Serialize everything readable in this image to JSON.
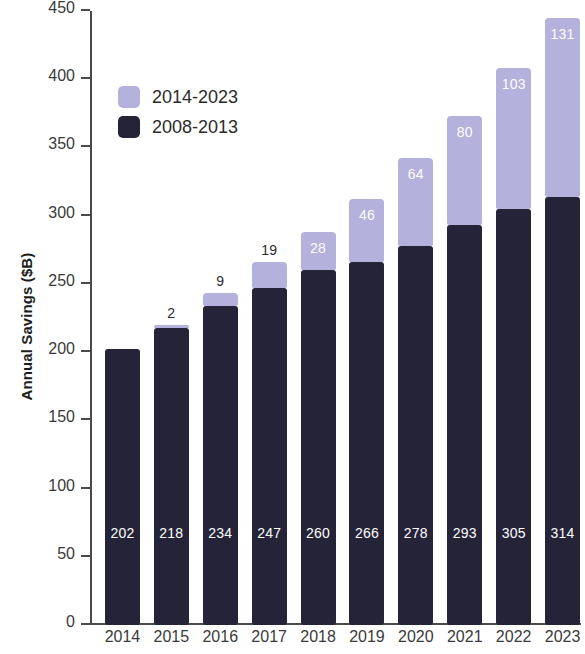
{
  "chart_data": {
    "type": "bar",
    "subtype": "stacked-vertical",
    "title": "",
    "xlabel": "",
    "ylabel": "Annual Savings ($B)",
    "ylim": [
      0,
      450
    ],
    "ytick_step": 50,
    "yticks": [
      450,
      400,
      350,
      300,
      250,
      200,
      150,
      100,
      50,
      0
    ],
    "ytick_labels": [
      "450",
      "400",
      "350",
      "300",
      "250",
      "200",
      "150",
      "100",
      "50",
      "0"
    ],
    "grid": false,
    "legend_position": "upper-left-inside",
    "categories": [
      "2014",
      "2015",
      "2016",
      "2017",
      "2018",
      "2019",
      "2020",
      "2021",
      "2022",
      "2023"
    ],
    "series": [
      {
        "name": "2008-2013",
        "color": "#252338",
        "values": [
          202,
          218,
          234,
          247,
          260,
          266,
          278,
          293,
          305,
          314
        ],
        "labels": [
          "202",
          "218",
          "234",
          "247",
          "260",
          "266",
          "278",
          "293",
          "305",
          "314"
        ]
      },
      {
        "name": "2014-2023",
        "color": "#b4b1dc",
        "values": [
          0,
          2,
          9,
          19,
          28,
          46,
          64,
          80,
          103,
          131
        ],
        "labels": [
          "",
          "2",
          "9",
          "19",
          "28",
          "46",
          "64",
          "80",
          "103",
          "131"
        ]
      }
    ],
    "totals": [
      202,
      220,
      243,
      266,
      288,
      312,
      342,
      373,
      408,
      445
    ]
  },
  "legend": {
    "items": [
      {
        "label": "2014-2023",
        "color": "#b4b1dc"
      },
      {
        "label": "2008-2013",
        "color": "#252338"
      }
    ]
  },
  "colors": {
    "light_series": "#b4b1dc",
    "dark_series": "#252338",
    "axis": "#4a4a4a",
    "text": "#2b2b2b",
    "background": "#ffffff"
  }
}
